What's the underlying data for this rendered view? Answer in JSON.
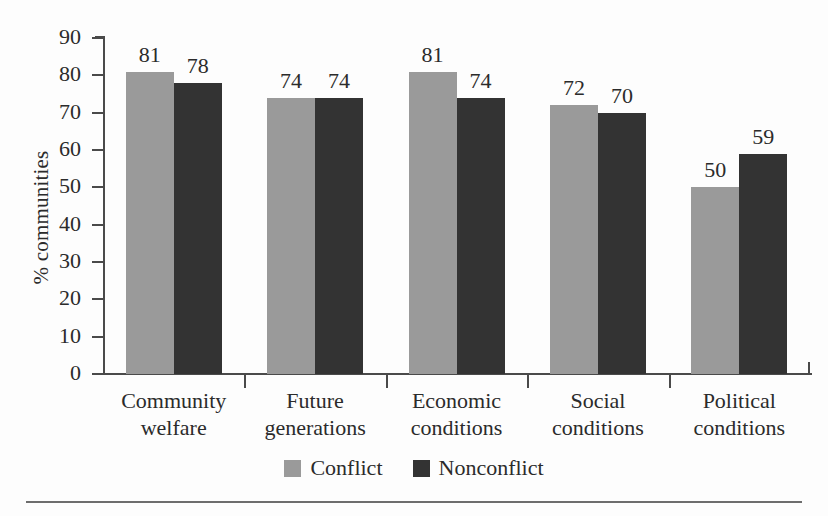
{
  "chart_data": {
    "type": "bar",
    "title": "",
    "xlabel": "",
    "ylabel": "% communities",
    "ylim": [
      0,
      90
    ],
    "ytick_step": 10,
    "yticks": [
      "90",
      "80",
      "70",
      "60",
      "50",
      "40",
      "30",
      "20",
      "10",
      "0"
    ],
    "grid": false,
    "legend_position": "bottom-center",
    "categories": [
      "Community welfare",
      "Future generations",
      "Economic conditions",
      "Social conditions",
      "Political conditions"
    ],
    "categories_lines": [
      [
        "Community",
        "welfare"
      ],
      [
        "Future",
        "generations"
      ],
      [
        "Economic",
        "conditions"
      ],
      [
        "Social",
        "conditions"
      ],
      [
        "Political",
        "conditions"
      ]
    ],
    "series": [
      {
        "name": "Conflict",
        "color": "#9a9a9a",
        "values": [
          81,
          74,
          81,
          72,
          50
        ]
      },
      {
        "name": "Nonconflict",
        "color": "#333333",
        "values": [
          78,
          74,
          74,
          70,
          59
        ]
      }
    ]
  },
  "legend": {
    "items": [
      {
        "label": "Conflict",
        "swatch": "conflict"
      },
      {
        "label": "Nonconflict",
        "swatch": "nonconflict"
      }
    ]
  }
}
